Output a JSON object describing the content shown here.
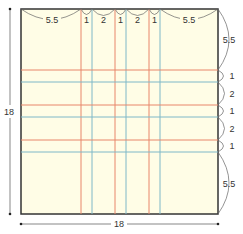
{
  "diagram": {
    "type": "folding-square-pattern",
    "colors": {
      "paper": "#fffde6",
      "border": "#333333",
      "orange_line": "#e8866a",
      "blue_line": "#7fb8c8",
      "dimension": "#555555"
    },
    "overall": {
      "width_label": "18",
      "height_label": "18"
    },
    "top_segments": [
      "5.5",
      "1",
      "2",
      "1",
      "2",
      "1",
      "5.5"
    ],
    "right_segments": [
      "5.5",
      "1",
      "2",
      "1",
      "2",
      "1",
      "5.5"
    ]
  }
}
